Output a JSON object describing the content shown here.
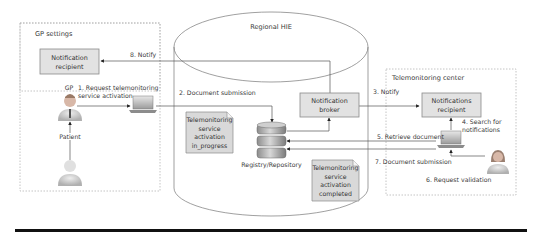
{
  "diagram": {
    "colors": {
      "box_fill": "#e2e2e2",
      "box_stroke": "#8a8a8a",
      "note_fill": "#d9d9d9",
      "line": "#555555",
      "dashed_border": "#b5b5b5",
      "rule": "#111111"
    },
    "zones": {
      "gp": {
        "label": "GP settings"
      },
      "hie": {
        "label": "Regional HIE"
      },
      "tm": {
        "label": "Telemonitoring center"
      }
    },
    "nodes": {
      "gp_notification_recipient": {
        "line1": "Notification",
        "line2": "recipient"
      },
      "notification_broker": {
        "line1": "Notification",
        "line2": "broker"
      },
      "tm_notifications_recipient": {
        "line1": "Notifications",
        "line2": "recipient"
      },
      "registry": {
        "label": "Registry/Repository"
      },
      "gp_actor": {
        "label": "GP"
      },
      "patient_actor": {
        "label": "Patient"
      }
    },
    "notes": {
      "in_progress": {
        "l1": "Telemonitoring",
        "l2": "service",
        "l3": "activation",
        "l4": "in_progress"
      },
      "completed": {
        "l1": "Telemonitoring",
        "l2": "service",
        "l3": "activation",
        "l4": "completed"
      }
    },
    "steps": {
      "s1_line1": "1. Request telemonitoring",
      "s1_line2": "service activation",
      "s2": "2. Document submission",
      "s3": "3. Notify",
      "s4_line1": "4. Search for",
      "s4_line2": "notifications",
      "s5": "5. Retrieve document",
      "s6": "6. Request validation",
      "s7": "7. Document submission",
      "s8": "8. Notify"
    }
  }
}
